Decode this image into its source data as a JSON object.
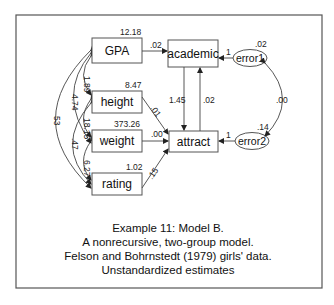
{
  "nodes": {
    "gpa": {
      "label": "GPA",
      "variance": "12.18"
    },
    "height": {
      "label": "height",
      "variance": "8.47"
    },
    "weight": {
      "label": "weight",
      "variance": "373.26"
    },
    "rating": {
      "label": "rating",
      "variance": "1.02"
    },
    "academic": {
      "label": "academic"
    },
    "attract": {
      "label": "attract"
    },
    "error1": {
      "label": "error1",
      "variance": ".02"
    },
    "error2": {
      "label": "error2",
      "variance": ".14"
    }
  },
  "paths": {
    "gpa_academic": ".02",
    "height_attract": ".01",
    "weight_attract": ".00",
    "rating_attract": ".15",
    "academic_attract": "1.45",
    "attract_academic": ".02",
    "error1_academic": "1",
    "error2_attract": "1"
  },
  "covariances": {
    "gpa_height": "1.89",
    "gpa_weight": "4.74",
    "gpa_rating": "53",
    "height_weight": "18.15",
    "height_rating": ".47",
    "weight_rating": "6.27",
    "error1_error2": ".00"
  },
  "caption": {
    "line1": "Example 11: Model B.",
    "line2": "A nonrecursive, two-group model.",
    "line3": "Felson and Bohrnstedt (1979) girls' data.",
    "line4": "Unstandardized estimates"
  }
}
